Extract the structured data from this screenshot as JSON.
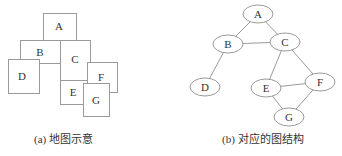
{
  "map": {
    "caption": "(a) 地图示意",
    "regions": [
      {
        "label": "A",
        "x": 43,
        "y": 13,
        "w": 33,
        "h": 27,
        "tx": 59,
        "ty": 30
      },
      {
        "label": "B",
        "x": 20,
        "y": 40,
        "w": 40,
        "h": 23,
        "tx": 40,
        "ty": 56
      },
      {
        "label": "C",
        "x": 60,
        "y": 40,
        "w": 30,
        "h": 40,
        "tx": 75,
        "ty": 63
      },
      {
        "label": "D",
        "x": 8,
        "y": 59,
        "w": 31,
        "h": 34,
        "tx": 22,
        "ty": 80
      },
      {
        "label": "E",
        "x": 60,
        "y": 80,
        "w": 28,
        "h": 24,
        "tx": 73,
        "ty": 96
      },
      {
        "label": "F",
        "x": 87,
        "y": 62,
        "w": 30,
        "h": 30,
        "tx": 101,
        "ty": 81
      },
      {
        "label": "G",
        "x": 83,
        "y": 83,
        "w": 26,
        "h": 33,
        "tx": 96,
        "ty": 104
      }
    ]
  },
  "graph": {
    "caption": "(b) 对应的图结构",
    "nodes": [
      {
        "label": "A",
        "cx": 258,
        "cy": 14
      },
      {
        "label": "B",
        "cx": 228,
        "cy": 44
      },
      {
        "label": "C",
        "cx": 285,
        "cy": 42
      },
      {
        "label": "D",
        "cx": 205,
        "cy": 87
      },
      {
        "label": "E",
        "cx": 266,
        "cy": 88
      },
      {
        "label": "F",
        "cx": 320,
        "cy": 82
      },
      {
        "label": "G",
        "cx": 289,
        "cy": 117
      }
    ],
    "edges": [
      [
        "A",
        "B"
      ],
      [
        "A",
        "C"
      ],
      [
        "B",
        "C"
      ],
      [
        "B",
        "D"
      ],
      [
        "C",
        "E"
      ],
      [
        "C",
        "F"
      ],
      [
        "E",
        "F"
      ],
      [
        "E",
        "G"
      ],
      [
        "F",
        "G"
      ]
    ]
  },
  "colors": {
    "stroke": "#9a9a9a",
    "text": "#333333"
  }
}
